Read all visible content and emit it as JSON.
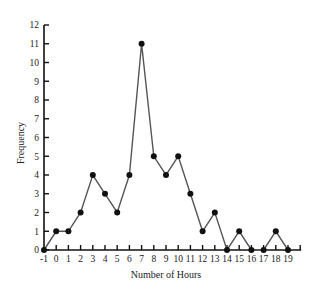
{
  "chart_data": {
    "type": "line",
    "title": "",
    "xlabel": "Number of Hours",
    "ylabel": "Frequency",
    "x": [
      -1,
      0,
      1,
      2,
      3,
      4,
      5,
      6,
      7,
      8,
      9,
      10,
      11,
      12,
      13,
      14,
      15,
      16,
      17,
      18,
      19
    ],
    "values": [
      0,
      1,
      1,
      2,
      4,
      3,
      2,
      4,
      11,
      5,
      4,
      5,
      3,
      1,
      2,
      0,
      1,
      0,
      0,
      1,
      0
    ],
    "x_ticks": [
      -1,
      0,
      1,
      2,
      3,
      4,
      5,
      6,
      7,
      8,
      9,
      10,
      11,
      12,
      13,
      14,
      15,
      16,
      17,
      18,
      19
    ],
    "y_ticks": [
      0,
      1,
      2,
      3,
      4,
      5,
      6,
      7,
      8,
      9,
      10,
      11,
      12
    ],
    "xlim": [
      -1,
      20
    ],
    "ylim": [
      0,
      12
    ],
    "grid": false,
    "legend": "none",
    "colors": {
      "line": "#555555",
      "marker": "#111111",
      "axis": "#111111"
    }
  }
}
